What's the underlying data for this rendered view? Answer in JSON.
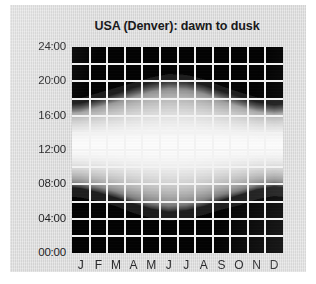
{
  "chart_data": {
    "type": "heatmap",
    "title": "USA (Denver): dawn to dusk",
    "xlabel": "",
    "ylabel": "",
    "grid": true,
    "legend": "none",
    "categories": [
      "J",
      "F",
      "M",
      "A",
      "M",
      "J",
      "J",
      "A",
      "S",
      "O",
      "N",
      "D"
    ],
    "month_names": [
      "January",
      "February",
      "March",
      "April",
      "May",
      "June",
      "July",
      "August",
      "September",
      "October",
      "November",
      "December"
    ],
    "ylim": [
      0,
      24
    ],
    "yticks": [
      0,
      4,
      8,
      12,
      16,
      20,
      24
    ],
    "ytick_labels": [
      "00:00",
      "04:00",
      "08:00",
      "12:00",
      "16:00",
      "20:00",
      "24:00"
    ],
    "xtick_labels": [
      "J",
      "F",
      "M",
      "A",
      "M",
      "J",
      "J",
      "A",
      "S",
      "O",
      "N",
      "D"
    ],
    "value_label": "sky brightness",
    "series": [
      {
        "name": "dawn",
        "label": "dawn (sunrise time, hours)",
        "values": [
          7.3,
          6.9,
          6.3,
          5.5,
          4.9,
          4.6,
          4.8,
          5.3,
          5.9,
          6.4,
          7.1,
          7.5
        ]
      },
      {
        "name": "dusk",
        "label": "dusk (sunset time, hours)",
        "values": [
          17.2,
          17.8,
          18.4,
          19.0,
          19.6,
          20.0,
          19.9,
          19.4,
          18.6,
          17.9,
          17.3,
          17.0
        ]
      }
    ],
    "brightness_peak_hour": 12.5,
    "colors": {
      "night": "#050505",
      "twilight": "#6b6b6b",
      "day_mid": "#b8b8b8",
      "noon": "#f4f4f4",
      "gridline": "#f2f2f2",
      "panel_background": "#dcdcdc",
      "page_background": "#ffffff",
      "text": "#1d1d1f"
    }
  },
  "figure": {
    "title": "USA (Denver): dawn to dusk"
  }
}
